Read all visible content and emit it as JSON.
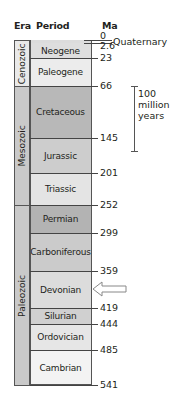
{
  "headers": {
    "era": "Era",
    "period": "Period",
    "ma": "Ma"
  },
  "eras": [
    {
      "name": "Cenozoic",
      "top": 40,
      "bottom": 86,
      "color": "#e9e9e9"
    },
    {
      "name": "Mesozoic",
      "top": 86,
      "bottom": 205,
      "color": "#c9c9c9"
    },
    {
      "name": "Paleozoic",
      "top": 205,
      "bottom": 385,
      "color": "#c9c9c9"
    }
  ],
  "periods": [
    {
      "name": "Quaternary",
      "top": 40,
      "bottom": 43,
      "color": "#dcdcdc"
    },
    {
      "name": "Neogene",
      "top": 43,
      "bottom": 58,
      "color": "#dedede"
    },
    {
      "name": "Paleogene",
      "top": 58,
      "bottom": 86,
      "color": "#ececec"
    },
    {
      "name": "Cretaceous",
      "top": 86,
      "bottom": 138,
      "color": "#b8b8b8"
    },
    {
      "name": "Jurassic",
      "top": 138,
      "bottom": 173,
      "color": "#cdcdcd"
    },
    {
      "name": "Triassic",
      "top": 173,
      "bottom": 205,
      "color": "#e4e4e4"
    },
    {
      "name": "Permian",
      "top": 205,
      "bottom": 233,
      "color": "#b3b3b3"
    },
    {
      "name": "Carboniferous",
      "top": 233,
      "bottom": 271,
      "color": "#cbcbcb"
    },
    {
      "name": "Devonian",
      "top": 271,
      "bottom": 308,
      "color": "#dcdcdc"
    },
    {
      "name": "Silurian",
      "top": 308,
      "bottom": 324,
      "color": "#d0d0d0"
    },
    {
      "name": "Ordovician",
      "top": 324,
      "bottom": 350,
      "color": "#e6e6e6"
    },
    {
      "name": "Cambrian",
      "top": 350,
      "bottom": 385,
      "color": "#f3f3f3"
    }
  ],
  "ma_ticks": [
    {
      "label": "0",
      "y": 40
    },
    {
      "label": "2.6",
      "y": 43
    },
    {
      "label": "23",
      "y": 58
    },
    {
      "label": "66",
      "y": 86
    },
    {
      "label": "145",
      "y": 138
    },
    {
      "label": "201",
      "y": 173
    },
    {
      "label": "252",
      "y": 205
    },
    {
      "label": "299",
      "y": 233
    },
    {
      "label": "359",
      "y": 271
    },
    {
      "label": "419",
      "y": 308
    },
    {
      "label": "444",
      "y": 324
    },
    {
      "label": "485",
      "y": 350
    },
    {
      "label": "541",
      "y": 385
    }
  ],
  "quaternary_label": "Quaternary",
  "scale_bar": {
    "line1": "100",
    "line2": "million",
    "line3": "years",
    "top": 86,
    "bottom": 151
  },
  "highlight_arrow": {
    "target": "Devonian",
    "y": 289,
    "fill": "#ffffff",
    "stroke": "#888888"
  }
}
